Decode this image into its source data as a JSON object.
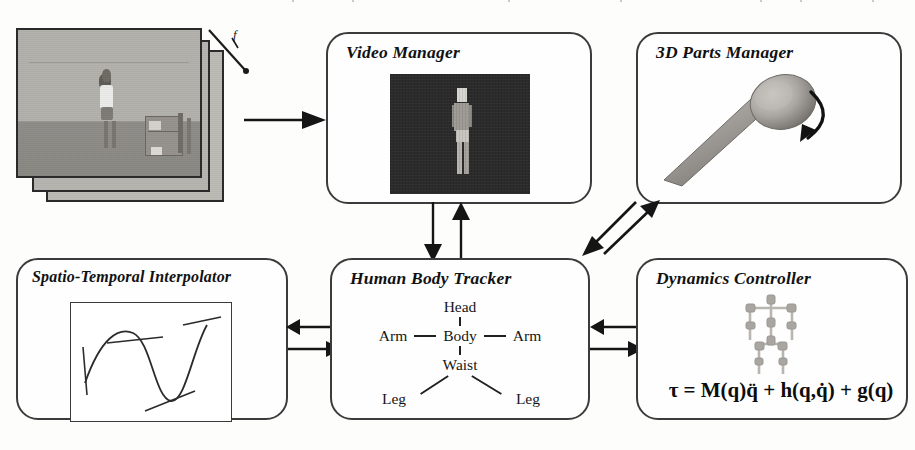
{
  "diagram": {
    "modules": [
      {
        "id": "video-manager",
        "label": "Video Manager",
        "content_kind": "segmented-silhouette-image",
        "content_description": "Dark frame with a segmented human silhouette (head, torso, hip, legs)"
      },
      {
        "id": "parts-manager",
        "label": "3D Parts Manager",
        "content_kind": "3d-limb-render",
        "content_description": "Shaded 3D cylindrical limb with rounded end cap and a curved rotation arrow"
      },
      {
        "id": "spatio-temporal-interpolator",
        "label": "Spatio-Temporal Interpolator",
        "content_kind": "spline-plot",
        "content_description": "Interpolating spline curve with straight tangent handles at control points inside a rectangular frame"
      },
      {
        "id": "human-body-tracker",
        "label": "Human Body Tracker",
        "content_kind": "body-part-tree",
        "content_description": "Kinematic tree of body parts"
      },
      {
        "id": "dynamics-controller",
        "label": "Dynamics Controller",
        "content_kind": "skeleton-and-equation",
        "content_description": "Light gray articulated joint skeleton above the rigid-body dynamics equation"
      }
    ],
    "body_tree": {
      "head": "Head",
      "arm_left": "Arm",
      "body": "Body",
      "arm_right": "Arm",
      "waist": "Waist",
      "leg_left": "Leg",
      "leg_right": "Leg"
    },
    "dynamics_equation": "τ = M(q)q̈ + h(q,q̇) + g(q)",
    "dynamics_equation_parts": {
      "tau": "τ",
      "equals": "=",
      "inertia_term": "M(q)q̈",
      "plus_1": "+",
      "coriolis_term": "h(q,q̇)",
      "plus_2": "+",
      "gravity_term": "g(q)"
    },
    "input_stack": {
      "name": "video-frame-stack",
      "description": "Stack of grayscale video frames showing a standing person in a room",
      "axis_label": "f",
      "frame_count": 3
    },
    "connectors": [
      {
        "id": "frames-to-video-manager",
        "from": "video-frame-stack",
        "to": "video-manager",
        "direction": "right"
      },
      {
        "id": "video-manager-to-tracker",
        "from": "video-manager",
        "to": "human-body-tracker",
        "direction": "down"
      },
      {
        "id": "tracker-to-video-manager",
        "from": "human-body-tracker",
        "to": "video-manager",
        "direction": "up"
      },
      {
        "id": "tracker-to-parts-manager",
        "from": "human-body-tracker",
        "to": "parts-manager",
        "direction": "up-right"
      },
      {
        "id": "parts-manager-to-tracker",
        "from": "parts-manager",
        "to": "human-body-tracker",
        "direction": "down-left"
      },
      {
        "id": "tracker-to-interpolator",
        "from": "human-body-tracker",
        "to": "spatio-temporal-interpolator",
        "direction": "left"
      },
      {
        "id": "interpolator-to-tracker",
        "from": "spatio-temporal-interpolator",
        "to": "human-body-tracker",
        "direction": "right"
      },
      {
        "id": "tracker-to-dynamics",
        "from": "human-body-tracker",
        "to": "dynamics-controller",
        "direction": "right"
      },
      {
        "id": "dynamics-to-tracker",
        "from": "dynamics-controller",
        "to": "human-body-tracker",
        "direction": "left"
      }
    ],
    "colors": {
      "outline": "#3b3b3b",
      "arrow": "#151515",
      "page_background": "#fdfdfc",
      "video_canvas": "#2b2b2b",
      "frame_gray": "#b3b1ac",
      "skeleton_gray": "#b9b6b1",
      "limb_gray": "#9a9792"
    }
  }
}
